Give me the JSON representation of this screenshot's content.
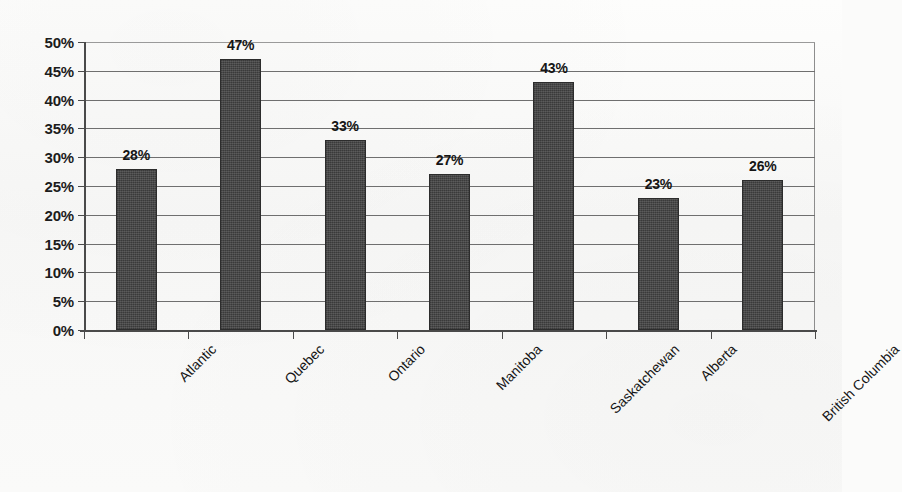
{
  "chart_data": {
    "type": "bar",
    "title": "",
    "subtitle": "",
    "xlabel": "",
    "ylabel": "",
    "categories": [
      "Atlantic",
      "Quebec",
      "Ontario",
      "Manitoba",
      "Saskatchewan",
      "Alberta",
      "British Columbia"
    ],
    "values": [
      28,
      47,
      33,
      27,
      43,
      23,
      26
    ],
    "value_labels": [
      "28%",
      "47%",
      "33%",
      "27%",
      "43%",
      "23%",
      "26%"
    ],
    "ylim": [
      0,
      50
    ],
    "ytick_values": [
      0,
      5,
      10,
      15,
      20,
      25,
      30,
      35,
      40,
      45,
      50
    ],
    "ytick_labels": [
      "0%",
      "5%",
      "10%",
      "15%",
      "20%",
      "25%",
      "30%",
      "35%",
      "40%",
      "45%",
      "50%"
    ],
    "grid": true,
    "legend": "none",
    "bar_color": "#3a3a3a",
    "gridline_color": "#6f6f6f",
    "axis_color": "#4a4a4a",
    "background_color": "#fbfbfa",
    "category_label_rotation": -45,
    "data_labels_shown": true
  }
}
